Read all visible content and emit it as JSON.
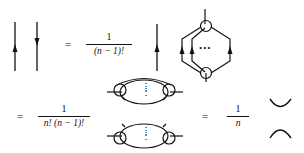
{
  "figure": {
    "row1": {
      "lhs": "two-antiparallel-lines",
      "equals": "=",
      "coefficient": {
        "numerator": "1",
        "denominator": "(n − 1)!"
      },
      "rhs": "line-times-hexagon-loop-with-dots",
      "dots": "•••"
    },
    "row2": {
      "equals": "=",
      "coefficient": {
        "numerator": "1",
        "denominator": "n! (n − 1)!"
      },
      "rhs": "two-stacked-loop-diagrams",
      "dots": "⋮"
    },
    "row3": {
      "equals": "=",
      "coefficient": {
        "numerator": "1",
        "denominator": "n"
      },
      "rhs": "cup-and-cap-arcs"
    }
  }
}
